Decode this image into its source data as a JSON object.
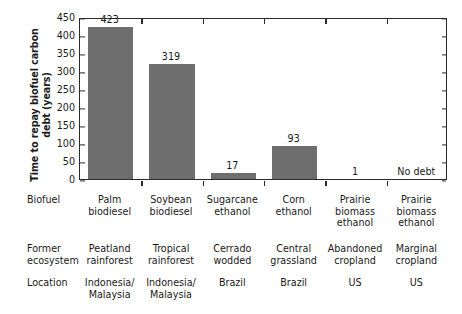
{
  "chart_data": {
    "type": "bar",
    "title": "",
    "xlabel": "",
    "ylabel": "Time to repay biofuel\ncarbon debt (years)",
    "ylim": [
      0,
      450
    ],
    "yticks": [
      0,
      50,
      100,
      150,
      200,
      250,
      300,
      350,
      400,
      450
    ],
    "grid": false,
    "legend": "none",
    "bar_color": "#6e6e6e",
    "categories": [
      "Palm\nbiodiesel",
      "Soybean\nbiodiesel",
      "Sugarcane\nethanol",
      "Corn\nethanol",
      "Prairie\nbiomass\nethanol",
      "Prairie\nbiomass\nethanol"
    ],
    "values": [
      423,
      319,
      17,
      93,
      1,
      0
    ],
    "value_labels": [
      "423",
      "319",
      "17",
      "93",
      "1",
      "No debt"
    ],
    "annotations": [
      "No debt shown for sixth category"
    ]
  },
  "table": {
    "row_labels": [
      "Biofuel",
      "Former\necosystem",
      "Location"
    ],
    "rows": {
      "biofuel": [
        "Palm\nbiodiesel",
        "Soybean\nbiodiesel",
        "Sugarcane\nethanol",
        "Corn\nethanol",
        "Prairie\nbiomass\nethanol",
        "Prairie\nbiomass\nethanol"
      ],
      "former_ecosystem": [
        "Peatland\nrainforest",
        "Tropical\nrainforest",
        "Cerrado\nwodded",
        "Central\ngrassland",
        "Abandoned\ncropland",
        "Marginal\ncropland"
      ],
      "location": [
        "Indonesia/\nMalaysia",
        "Indonesia/\nMalaysia",
        "Brazil",
        "Brazil",
        "US",
        "US"
      ]
    }
  },
  "colors": {
    "bar": "#6e6e6e",
    "axis": "#2a2a2a",
    "text": "#1a1a1a",
    "background": "#ffffff"
  }
}
